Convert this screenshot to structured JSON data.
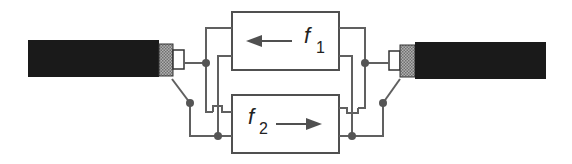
{
  "diagram": {
    "boxes": [
      {
        "id": "f1",
        "label": "f",
        "subscript": "1",
        "arrow_direction": "left"
      },
      {
        "id": "f2",
        "label": "f",
        "subscript": "2",
        "arrow_direction": "right"
      }
    ],
    "cables": [
      {
        "id": "left-cable",
        "side": "left"
      },
      {
        "id": "right-cable",
        "side": "right"
      }
    ],
    "colors": {
      "cable": "#1a1a1a",
      "connector_knurl": "#9a9a9a",
      "wire": "#606060",
      "junction_dot": "#555555",
      "box_stroke": "#505050"
    }
  }
}
